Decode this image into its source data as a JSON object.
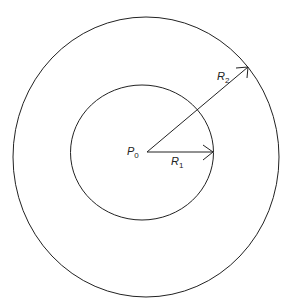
{
  "diagram": {
    "labels": {
      "center": {
        "main": "P",
        "sub": "0"
      },
      "r1": {
        "main": "R",
        "sub": "1"
      },
      "r2": {
        "main": "R",
        "sub": "2"
      }
    },
    "colors": {
      "stroke": "#222222",
      "background": "#ffffff"
    }
  }
}
